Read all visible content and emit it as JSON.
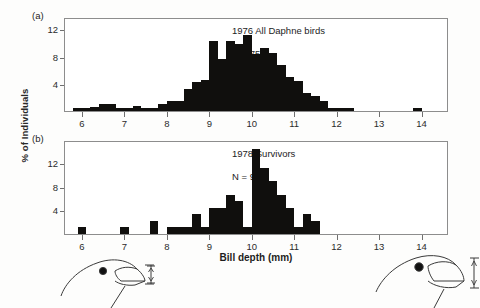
{
  "figure": {
    "y_axis_label": "% of Individuals",
    "x_axis_label": "Bill depth (mm)"
  },
  "panels": [
    {
      "letter": "(a)",
      "title": "1976 All Daphne birds",
      "sample": "N = 751"
    },
    {
      "letter": "(b)",
      "title": "1978 Survivors",
      "sample": "N = 90"
    }
  ],
  "illustrations": [
    {
      "name": "finch-head-small-bill",
      "caption": ""
    },
    {
      "name": "finch-head-large-bill",
      "caption": ""
    }
  ],
  "chart_data": [
    {
      "type": "bar",
      "title": "1976 All Daphne birds",
      "annotation": "N = 751",
      "panel": "(a)",
      "xlabel": "Bill depth (mm)",
      "ylabel": "% of Individuals",
      "xlim": [
        5.6,
        14.6
      ],
      "ylim": [
        0,
        13.5
      ],
      "bin_width": 0.2,
      "xticks": [
        6,
        7,
        8,
        9,
        10,
        11,
        12,
        13,
        14
      ],
      "yticks": [
        4,
        8,
        12
      ],
      "grid": false,
      "legend": "none",
      "bin_starts": [
        5.8,
        6.0,
        6.2,
        6.4,
        6.6,
        6.8,
        7.0,
        7.2,
        7.4,
        7.6,
        7.8,
        8.0,
        8.2,
        8.4,
        8.6,
        8.8,
        9.0,
        9.2,
        9.4,
        9.6,
        9.8,
        10.0,
        10.2,
        10.4,
        10.6,
        10.8,
        11.0,
        11.2,
        11.4,
        11.6,
        11.8,
        12.0,
        12.2,
        13.8
      ],
      "values": [
        0.4,
        0.4,
        0.6,
        1.0,
        1.0,
        0.5,
        0.4,
        0.7,
        0.4,
        0.4,
        1.0,
        1.4,
        1.5,
        3.2,
        4.2,
        4.6,
        10.3,
        7.7,
        10.3,
        9.8,
        11.2,
        8.4,
        9.3,
        8.5,
        6.8,
        5.0,
        4.4,
        2.6,
        2.2,
        1.5,
        0.5,
        0.4,
        0.4,
        0.5
      ]
    },
    {
      "type": "bar",
      "title": "1978 Survivors",
      "annotation": "N = 90",
      "panel": "(b)",
      "xlabel": "Bill depth (mm)",
      "ylabel": "% of Individuals",
      "xlim": [
        5.6,
        14.6
      ],
      "ylim": [
        0,
        15.5
      ],
      "bin_width": 0.2,
      "xticks": [
        6,
        7,
        8,
        9,
        10,
        11,
        12,
        13,
        14
      ],
      "yticks": [
        4,
        8,
        12
      ],
      "grid": false,
      "legend": "none",
      "bin_starts": [
        5.9,
        6.9,
        7.6,
        8.0,
        8.2,
        8.4,
        8.6,
        8.8,
        9.0,
        9.2,
        9.4,
        9.6,
        9.8,
        10.0,
        10.2,
        10.4,
        10.6,
        10.8,
        11.0,
        11.2,
        11.4
      ],
      "values": [
        1.1,
        1.1,
        2.2,
        1.1,
        1.1,
        1.1,
        3.3,
        1.1,
        4.4,
        4.4,
        6.6,
        5.5,
        1.1,
        14.4,
        11.1,
        9.0,
        6.6,
        4.4,
        1.1,
        3.3,
        2.2
      ]
    }
  ]
}
